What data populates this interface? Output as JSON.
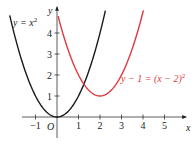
{
  "chart_data": {
    "type": "line",
    "title": "",
    "xlabel": "x",
    "ylabel": "y",
    "origin_label": "O",
    "xlim": [
      -1.5,
      5.8
    ],
    "ylim": [
      -0.5,
      5.2
    ],
    "grid": false,
    "x_ticks": [
      -1,
      1,
      2,
      3,
      4,
      5
    ],
    "x_tick_labels": [
      "−1",
      "1",
      "2",
      "3",
      "4",
      "5"
    ],
    "y_ticks": [
      1,
      2,
      3,
      4
    ],
    "y_tick_labels": [
      "1",
      "2",
      "3",
      "4"
    ],
    "series": [
      {
        "name": "y = x²",
        "equation": "y = x^2",
        "color": "#1a1a1a",
        "label": {
          "prefix": "y = x",
          "sup": "2"
        },
        "x": [
          -2.2,
          -2,
          -1.5,
          -1,
          -0.5,
          0,
          0.5,
          1,
          1.5,
          2,
          2.25
        ],
        "y": [
          4.84,
          4,
          2.25,
          1,
          0.25,
          0,
          0.25,
          1,
          2.25,
          4,
          5.06
        ]
      },
      {
        "name": "y − 1 = (x − 2)²",
        "equation": "y - 1 = (x - 2)^2",
        "color": "#e0393e",
        "label": {
          "prefix": "y − 1 = (x − 2)",
          "sup": "2"
        },
        "x": [
          0.05,
          0.5,
          1,
          1.5,
          2,
          2.5,
          3,
          3.5,
          4,
          4.02
        ],
        "y": [
          4.8,
          3.25,
          2,
          1.25,
          1,
          1.25,
          2,
          3.25,
          5,
          5.08
        ]
      }
    ]
  }
}
